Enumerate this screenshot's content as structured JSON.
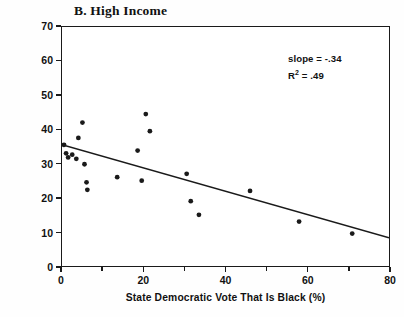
{
  "figure": {
    "panel_label": "B.  High Income"
  },
  "annotation": {
    "slope_text": "slope = -.34",
    "r2_prefix": "R",
    "r2_sup": "2",
    "r2_value": " = .49"
  },
  "chart_data": {
    "type": "scatter",
    "title": "B.  High Income",
    "xlabel": "State Democratic Vote That Is Black (%)",
    "ylabel": "High Income Whites Voting Democratic (%)",
    "xlim": [
      0,
      80
    ],
    "ylim": [
      0,
      70
    ],
    "xticks": [
      0,
      20,
      40,
      60,
      80
    ],
    "xticks_minor": [
      10,
      30,
      50,
      70
    ],
    "yticks": [
      0,
      10,
      20,
      30,
      40,
      50,
      60,
      70
    ],
    "grid": false,
    "legend": null,
    "marker": "filled-circle",
    "marker_color": "#1a1a1a",
    "marker_size_px": 4.6,
    "points": [
      {
        "x": 0.5,
        "y": 35.5
      },
      {
        "x": 1.0,
        "y": 33.0
      },
      {
        "x": 1.5,
        "y": 31.8
      },
      {
        "x": 2.5,
        "y": 32.6
      },
      {
        "x": 3.5,
        "y": 31.4
      },
      {
        "x": 4.0,
        "y": 37.5
      },
      {
        "x": 5.0,
        "y": 42.0
      },
      {
        "x": 5.5,
        "y": 29.8
      },
      {
        "x": 6.0,
        "y": 24.5
      },
      {
        "x": 6.2,
        "y": 22.3
      },
      {
        "x": 13.5,
        "y": 26.0
      },
      {
        "x": 18.5,
        "y": 33.8
      },
      {
        "x": 19.5,
        "y": 25.0
      },
      {
        "x": 20.5,
        "y": 44.5
      },
      {
        "x": 21.5,
        "y": 39.5
      },
      {
        "x": 30.5,
        "y": 27.0
      },
      {
        "x": 31.5,
        "y": 19.0
      },
      {
        "x": 33.5,
        "y": 15.0
      },
      {
        "x": 46.0,
        "y": 22.0
      },
      {
        "x": 58.0,
        "y": 13.0
      },
      {
        "x": 71.0,
        "y": 9.5
      }
    ],
    "fit_line": {
      "slope": -0.34,
      "intercept": 35.5,
      "r_squared": 0.49,
      "x_start": 0,
      "x_end": 80,
      "color": "#1a1a1a",
      "width_px": 1.5
    }
  }
}
